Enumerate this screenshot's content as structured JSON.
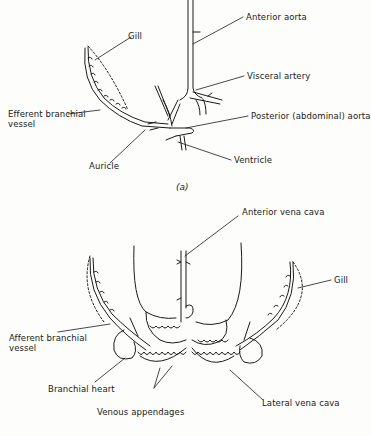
{
  "figure_a": {
    "caption": "(a)",
    "labels": {
      "gill": "Gill",
      "anterior_aorta": "Anterior aorta",
      "visceral_artery": "Visceral artery",
      "efferent_branchial_vessel_line1": "Efferent branchial",
      "efferent_branchial_vessel_line2": "vessel",
      "posterior_aorta": "Posterior (abdominal) aorta",
      "auricle": "Auricle",
      "ventricle": "Ventricle"
    }
  },
  "figure_b": {
    "labels": {
      "anterior_vena_cava": "Anterior vena cava",
      "gill": "Gill",
      "afferent_branchial_vessel_line1": "Afferent branchial",
      "afferent_branchial_vessel_line2": "vessel",
      "branchial_heart": "Branchial heart",
      "lateral_vena_cava": "Lateral vena cava",
      "venous_appendages": "Venous appendages"
    }
  }
}
